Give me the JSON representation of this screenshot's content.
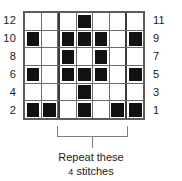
{
  "chart_data": {
    "type": "heatmap",
    "title": "",
    "xlabel": "",
    "ylabel": "",
    "columns": 7,
    "rows": 6,
    "legend": [],
    "grid": true,
    "row_labels_left": [
      "12",
      "10",
      "8",
      "6",
      "4",
      "2"
    ],
    "row_labels_right": [
      "11",
      "9",
      "7",
      "5",
      "3",
      "1"
    ],
    "cell_states": [
      [
        0,
        0,
        0,
        1,
        0,
        0,
        0
      ],
      [
        1,
        0,
        1,
        1,
        1,
        0,
        1
      ],
      [
        0,
        0,
        1,
        0,
        1,
        0,
        0
      ],
      [
        1,
        0,
        1,
        1,
        1,
        0,
        1
      ],
      [
        0,
        0,
        0,
        1,
        0,
        0,
        0
      ],
      [
        1,
        1,
        0,
        1,
        0,
        1,
        1
      ]
    ],
    "filled_color": "#111111",
    "empty_color": "#ffffff",
    "gridline_color": "#6b6b6b",
    "border_color": "#5c5c5c",
    "repeat_divider_color": "#3b3b3b",
    "repeat_section": {
      "start_column": 3,
      "end_column": 6,
      "stitch_count": "4"
    }
  },
  "caption": {
    "line1": "Repeat these",
    "count": "4",
    "line2": "stitches"
  }
}
